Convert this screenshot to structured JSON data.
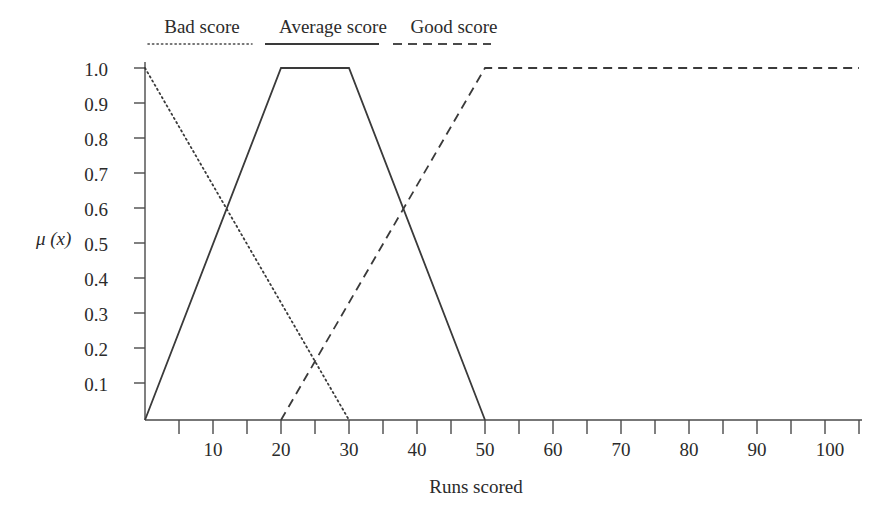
{
  "chart_data": {
    "type": "line",
    "title": "",
    "xlabel": "Runs scored",
    "ylabel": "μ (x)",
    "xlim": [
      0,
      105
    ],
    "ylim": [
      0,
      1.05
    ],
    "grid": false,
    "legend_position": "top",
    "x_ticks_major": [
      10,
      20,
      30,
      40,
      50,
      60,
      70,
      80,
      90,
      100
    ],
    "x_ticks_minor": [
      5,
      15,
      25,
      35,
      45,
      55,
      65,
      75,
      85,
      95,
      105
    ],
    "x_tick_labels": [
      "10",
      "20",
      "30",
      "40",
      "50",
      "60",
      "70",
      "80",
      "90",
      "100"
    ],
    "y_ticks": [
      0.1,
      0.2,
      0.3,
      0.4,
      0.5,
      0.6,
      0.7,
      0.8,
      0.9,
      1.0
    ],
    "y_tick_labels": [
      "0.1",
      "0.2",
      "0.3",
      "0.4",
      "0.5",
      "0.6",
      "0.7",
      "0.8",
      "0.9",
      "1.0"
    ],
    "series": [
      {
        "name": "Bad score",
        "style": "dotted",
        "color": "#3a3a3a",
        "points": [
          [
            0,
            1.0
          ],
          [
            30,
            0.0
          ]
        ]
      },
      {
        "name": "Average score",
        "style": "solid",
        "color": "#3a3a3a",
        "points": [
          [
            0,
            0.0
          ],
          [
            20,
            1.0
          ],
          [
            30,
            1.0
          ],
          [
            50,
            0.0
          ]
        ]
      },
      {
        "name": "Good score",
        "style": "dashed",
        "color": "#3a3a3a",
        "points": [
          [
            20,
            0.0
          ],
          [
            50,
            1.0
          ],
          [
            105,
            1.0
          ]
        ]
      }
    ]
  },
  "legend": {
    "items": [
      {
        "label": "Bad score",
        "style": "dotted"
      },
      {
        "label": "Average score",
        "style": "solid"
      },
      {
        "label": "Good score",
        "style": "dashed"
      }
    ]
  },
  "axes": {
    "y_label": "μ (x)",
    "x_label": "Runs scored",
    "y_tick_labels": [
      "1.0",
      "0.9",
      "0.8",
      "0.7",
      "0.6",
      "0.5",
      "0.4",
      "0.3",
      "0.2",
      "0.1"
    ],
    "x_tick_labels": [
      "10",
      "20",
      "30",
      "40",
      "50",
      "60",
      "70",
      "80",
      "90",
      "100"
    ]
  },
  "colors": {
    "line": "#3a3a3a",
    "axis": "#4a4a4a",
    "text": "#2b2b2b",
    "background": "#ffffff"
  }
}
